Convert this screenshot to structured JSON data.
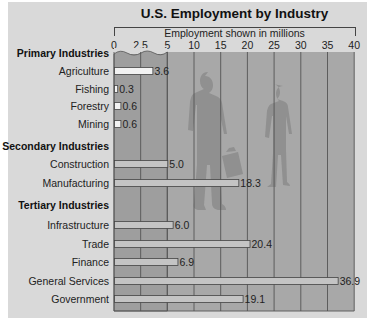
{
  "chart_data": {
    "type": "bar",
    "orientation": "horizontal",
    "title": "U.S. Employment by Industry",
    "xlabel": "Employment shown in millions",
    "ylabel": "",
    "xlim": [
      0,
      40
    ],
    "x_ticks": [
      "0",
      "2.5",
      "5",
      "10",
      "15",
      "20",
      "25",
      "30",
      "35",
      "40"
    ],
    "x_scale_note": "broken scale: 0-5 expanded, 5-40 compressed",
    "grid": true,
    "groups": [
      {
        "name": "Primary Industries",
        "categories": [
          "Agriculture",
          "Fishing",
          "Forestry",
          "Mining"
        ],
        "values": [
          3.6,
          0.3,
          0.6,
          0.6
        ],
        "labels": [
          "3.6",
          "0.3",
          "0.6",
          "0.6"
        ]
      },
      {
        "name": "Secondary Industries",
        "categories": [
          "Construction",
          "Manufacturing"
        ],
        "values": [
          5.0,
          18.3
        ],
        "labels": [
          "5.0",
          "18.3"
        ]
      },
      {
        "name": "Tertiary Industries",
        "categories": [
          "Infrastructure",
          "Trade",
          "Finance",
          "General Services",
          "Government"
        ],
        "values": [
          6.0,
          20.4,
          6.9,
          36.9,
          19.1
        ],
        "labels": [
          "6.0",
          "20.4",
          "6.9",
          "36.9",
          "19.1"
        ]
      }
    ],
    "categories": [
      "Agriculture",
      "Fishing",
      "Forestry",
      "Mining",
      "Construction",
      "Manufacturing",
      "Infrastructure",
      "Trade",
      "Finance",
      "General Services",
      "Government"
    ],
    "values": [
      3.6,
      0.3,
      0.6,
      0.6,
      5.0,
      18.3,
      6.0,
      20.4,
      6.9,
      36.9,
      19.1
    ]
  },
  "colors": {
    "panel": "#d9d9d9",
    "plot": "#a8a8a8",
    "plot_broken_region": "#9e9e9e",
    "gridline": "#555555",
    "bar_primary": "#f2f2f2",
    "bar_other": "#c4c4c4",
    "bar_stroke": "#444444",
    "silhouette": "#8c8c8c"
  }
}
